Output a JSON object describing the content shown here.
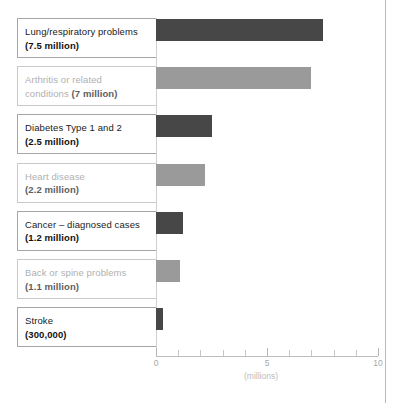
{
  "chart_data": {
    "type": "bar",
    "orientation": "horizontal",
    "title": "",
    "xlabel": "(millions)",
    "ylabel": "",
    "xlim": [
      0,
      10
    ],
    "grid": false,
    "legend": false,
    "axis": {
      "caption": "(millions)",
      "tick_labels": [
        "0",
        "5",
        "10"
      ],
      "tick_values": [
        0,
        5,
        10
      ],
      "minor_tick_values": [
        1,
        2,
        3,
        4,
        6,
        7,
        8,
        9
      ]
    },
    "categories": [
      "Lung/respiratory problems",
      "Arthritis or related conditions",
      "Diabetes Type 1 and 2",
      "Heart disease",
      "Cancer – diagnosed cases",
      "Back or spine problems",
      "Stroke"
    ],
    "values": [
      7.5,
      7,
      2.5,
      2.2,
      1.2,
      1.1,
      0.3
    ],
    "value_labels": [
      "(7.5 million)",
      "(7 million)",
      "(2.5 million)",
      "(2.2 million)",
      "(1.2 million)",
      "(1.1 million)",
      "(300,000)"
    ],
    "bars": [
      {
        "name": "Lung/respiratory problems",
        "label_line1": "Lung/respiratory problems",
        "label_line2": "(7.5 million)",
        "inline": false,
        "value": 7.5,
        "style": "dark"
      },
      {
        "name": "Arthritis or related conditions",
        "label_line1": "Arthritis or related",
        "label_line2": "conditions ",
        "label_line2_value": "(7 million)",
        "inline": true,
        "value": 7,
        "style": "light"
      },
      {
        "name": "Diabetes Type 1 and 2",
        "label_line1": "Diabetes Type 1 and 2",
        "label_line2": "(2.5 million)",
        "inline": false,
        "value": 2.5,
        "style": "dark"
      },
      {
        "name": "Heart disease",
        "label_line1": "Heart disease",
        "label_line2": "(2.2 million)",
        "inline": false,
        "value": 2.2,
        "style": "light"
      },
      {
        "name": "Cancer – diagnosed cases",
        "label_line1": "Cancer – diagnosed cases",
        "label_line2": "(1.2 million)",
        "inline": false,
        "value": 1.2,
        "style": "dark"
      },
      {
        "name": "Back or spine problems",
        "label_line1": "Back or spine problems",
        "label_line2": "(1.1 million)",
        "inline": false,
        "value": 1.1,
        "style": "light"
      },
      {
        "name": "Stroke",
        "label_line1": "Stroke",
        "label_line2": "(300,000)",
        "inline": false,
        "value": 0.3,
        "style": "dark"
      }
    ],
    "colors": {
      "bar_dark": "#474747",
      "bar_light": "#9a9a9a",
      "box_border_dark": "#a6a6a6",
      "box_border_light": "#c9c9c9",
      "text_dark": "#1a1a1a",
      "text_light": "#b0b0b0",
      "axis": "#bdbdbd",
      "page_edge": "#b9b9b9"
    }
  }
}
